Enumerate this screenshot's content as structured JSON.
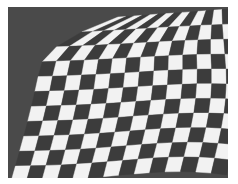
{
  "image": {
    "description": "Grayscale photo of a warped checkerboard pattern curving from upper-left, on a dark gray background",
    "colors": {
      "background": "#4a4a4a",
      "dark_square": "#3c3c3c",
      "light_square": "#f2f2f2",
      "margin": "#ffffff"
    },
    "grid": {
      "cols": 14,
      "rows": 11
    }
  }
}
